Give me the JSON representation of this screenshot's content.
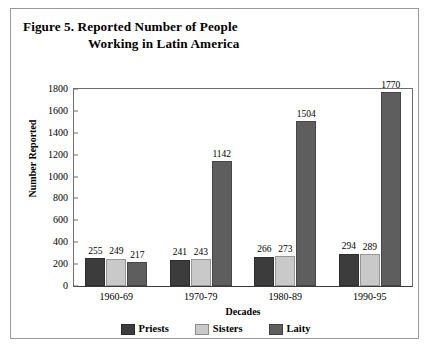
{
  "figure": {
    "caption_line1": "Figure 5.  Reported Number of People",
    "caption_line2": "Working in Latin America"
  },
  "colors": {
    "priests": "#3c3c3c",
    "sisters": "#c9c9c9",
    "laity": "#5e5e5e",
    "axis": "#3a3a3a",
    "frame": "#9a9a9a",
    "text": "#000000"
  },
  "chart_data": {
    "type": "bar",
    "title": "Figure 5.  Reported Number of People Working in Latin America",
    "xlabel": "Decades",
    "ylabel": "Number Reported",
    "categories": [
      "1960-69",
      "1970-79",
      "1980-89",
      "1990-95"
    ],
    "series": [
      {
        "name": "Priests",
        "color": "#3c3c3c",
        "values": [
          255,
          241,
          266,
          294
        ]
      },
      {
        "name": "Sisters",
        "color": "#c9c9c9",
        "values": [
          249,
          243,
          273,
          289
        ]
      },
      {
        "name": "Laity",
        "color": "#5e5e5e",
        "values": [
          217,
          1142,
          1504,
          1770
        ]
      }
    ],
    "ylim": [
      0,
      1800
    ],
    "yticks": [
      0,
      200,
      400,
      600,
      800,
      1000,
      1200,
      1400,
      1600,
      1800
    ],
    "grid": false,
    "legend_position": "bottom",
    "data_labels": true
  }
}
